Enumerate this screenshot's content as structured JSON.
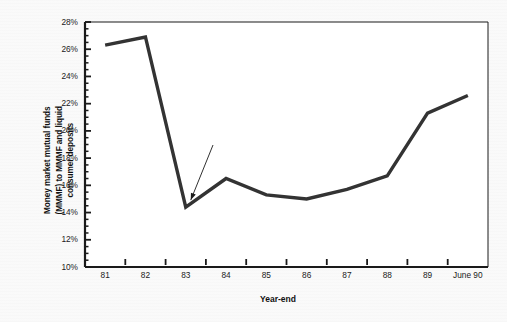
{
  "chart_data": {
    "type": "line",
    "title": "",
    "subtitle": "",
    "xlabel": "Year-end",
    "ylabel": "Money market mutual funds\n(MMMF) to MMMF and liquid\nconsumer deposits",
    "categories": [
      "81",
      "82",
      "83",
      "84",
      "85",
      "86",
      "87",
      "88",
      "89",
      "June 90"
    ],
    "values": [
      26.3,
      26.9,
      14.4,
      16.5,
      15.3,
      15.0,
      15.7,
      16.7,
      21.3,
      22.6
    ],
    "series": [
      {
        "name": "MMMF share of liquid consumer deposits",
        "values": [
          26.3,
          26.9,
          14.4,
          16.5,
          15.3,
          15.0,
          15.7,
          16.7,
          21.3,
          22.6
        ]
      }
    ],
    "ylim": [
      10,
      28
    ],
    "ytick_labels": [
      "28%",
      "26%",
      "24%",
      "22%",
      "20%",
      "18%",
      "16%",
      "14%",
      "12%",
      "10%"
    ],
    "ytick_values": [
      28,
      26,
      24,
      22,
      20,
      18,
      16,
      14,
      12,
      10
    ],
    "yminor_step": 0.5,
    "xtick_labels": [
      "81",
      "82",
      "83",
      "84",
      "85",
      "86",
      "87",
      "88",
      "89",
      "June 90"
    ],
    "grid": false,
    "legend": "none",
    "annotations": [
      {
        "text": "Introduction of money\nmarket deposits",
        "points_to_category": "83",
        "points_to_value": 14.4
      }
    ],
    "line_color": "#333333",
    "line_width_px": 3.4,
    "plot_background": "#ffffff",
    "frame_color": "#1a1a1a"
  },
  "figure": {
    "background_color": "#f3f3f3",
    "x_axis_title": "Year-end",
    "y_axis_title": "Money market mutual funds\n(MMMF) to MMMF and liquid\nconsumer deposits",
    "annotation_text": "Introduction of money\nmarket deposits"
  }
}
